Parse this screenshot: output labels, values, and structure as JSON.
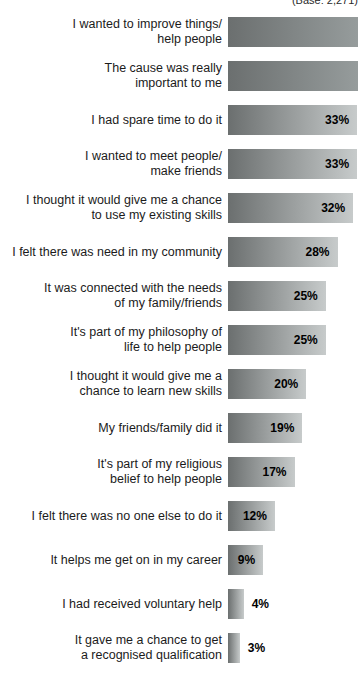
{
  "chart_data": {
    "type": "bar",
    "orientation": "horizontal",
    "title": "",
    "xlabel": "",
    "ylabel": "",
    "note": "(Base: 2,271)",
    "xlim": [
      0,
      34
    ],
    "grid": false,
    "legend": false,
    "clip_width_pct": 97.8,
    "categories": [
      "I wanted to improve things/ help people",
      "The cause was really important to me",
      "I had spare time to do it",
      "I wanted to meet people/ make friends",
      "I thought it would give me a chance to use my existing skills",
      "I felt there was need in my community",
      "It was connected with the needs of my family/friends",
      "It's part of my philosophy of life to help people",
      "I thought it would give me a chance to learn new skills",
      "My friends/family did it",
      "It's part of my religious belief to help people",
      "I felt there was no one else to do it",
      "It helps me get on in my career",
      "I had received voluntary help",
      "It gave me a chance to get a recognised qualification"
    ],
    "values": [
      null,
      null,
      33,
      33,
      32,
      28,
      25,
      25,
      20,
      19,
      17,
      12,
      9,
      4,
      3
    ],
    "colors": {
      "bar_gradient_start": "#6b6f6f",
      "bar_gradient_end": "#c7cbcb",
      "bar_gradient_end_clipped": "#969c9c",
      "value_label": "#000000",
      "category_label": "#1b1b1b"
    },
    "rows": [
      {
        "label_lines": [
          "I wanted to improve things/",
          "help people"
        ],
        "value": null,
        "value_label": "",
        "label_position": "none",
        "clipped": true
      },
      {
        "label_lines": [
          "The cause was really",
          "important to me"
        ],
        "value": null,
        "value_label": "",
        "label_position": "none",
        "clipped": true
      },
      {
        "label_lines": [
          "I had spare time to do it"
        ],
        "value": 33,
        "value_label": "33%",
        "label_position": "inside",
        "clipped": false
      },
      {
        "label_lines": [
          "I wanted to meet people/",
          "make friends"
        ],
        "value": 33,
        "value_label": "33%",
        "label_position": "inside",
        "clipped": false
      },
      {
        "label_lines": [
          "I thought it would give me a chance",
          "to use my existing skills"
        ],
        "value": 32,
        "value_label": "32%",
        "label_position": "inside",
        "clipped": false
      },
      {
        "label_lines": [
          "I felt there was need in my community"
        ],
        "value": 28,
        "value_label": "28%",
        "label_position": "inside",
        "clipped": false
      },
      {
        "label_lines": [
          "It was connected with the needs",
          "of my family/friends"
        ],
        "value": 25,
        "value_label": "25%",
        "label_position": "inside",
        "clipped": false
      },
      {
        "label_lines": [
          "It's part of my philosophy of",
          "life to help people"
        ],
        "value": 25,
        "value_label": "25%",
        "label_position": "inside",
        "clipped": false
      },
      {
        "label_lines": [
          "I thought it would give me a",
          "chance to learn new skills"
        ],
        "value": 20,
        "value_label": "20%",
        "label_position": "inside",
        "clipped": false
      },
      {
        "label_lines": [
          "My friends/family did it"
        ],
        "value": 19,
        "value_label": "19%",
        "label_position": "inside",
        "clipped": false
      },
      {
        "label_lines": [
          "It's part of my religious",
          "belief to help people"
        ],
        "value": 17,
        "value_label": "17%",
        "label_position": "inside",
        "clipped": false
      },
      {
        "label_lines": [
          "I felt there was no one else to do it"
        ],
        "value": 12,
        "value_label": "12%",
        "label_position": "inside",
        "clipped": false
      },
      {
        "label_lines": [
          "It helps me get on in my career"
        ],
        "value": 9,
        "value_label": "9%",
        "label_position": "inside",
        "clipped": false
      },
      {
        "label_lines": [
          "I had received voluntary help"
        ],
        "value": 4,
        "value_label": "4%",
        "label_position": "outside",
        "clipped": false
      },
      {
        "label_lines": [
          "It gave me a chance to get",
          "a recognised qualification"
        ],
        "value": 3,
        "value_label": "3%",
        "label_position": "outside",
        "clipped": false
      }
    ]
  }
}
